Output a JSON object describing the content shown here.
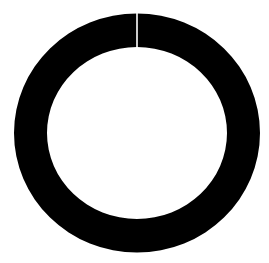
{
  "chart_data": {
    "type": "pie",
    "subtype": "donut",
    "title": "",
    "categories": [
      "Segment 1"
    ],
    "values": [
      100
    ],
    "colors": [
      "#000000"
    ],
    "separator_color": "#ffffff",
    "background": "#ffffff",
    "legend": "none",
    "start_angle_deg": 90
  }
}
